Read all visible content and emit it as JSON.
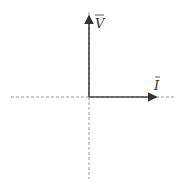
{
  "diagram": {
    "type": "phasor-diagram",
    "origin": {
      "x": 89,
      "y": 97
    },
    "axes": {
      "style": "dashed",
      "color": "#888888"
    },
    "phasors": [
      {
        "name": "V",
        "label": "V",
        "overbar": true,
        "direction": "up",
        "angle_deg": 90,
        "color": "#444444"
      },
      {
        "name": "I",
        "label": "I",
        "overbar": true,
        "direction": "right",
        "angle_deg": 0,
        "color": "#444444"
      }
    ]
  }
}
